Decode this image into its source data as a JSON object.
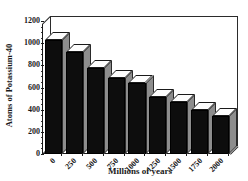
{
  "chart_data": {
    "type": "bar",
    "title": "",
    "xlabel": "Millions of years",
    "ylabel": "Atoms of Potassium-40",
    "categories": [
      "0",
      "250",
      "500",
      "750",
      "1000",
      "1250",
      "1500",
      "1750",
      "2000"
    ],
    "values": [
      1030,
      920,
      780,
      690,
      645,
      515,
      465,
      400,
      345
    ],
    "ylim": [
      0,
      1200
    ],
    "ytick_labels": [
      "0",
      "200",
      "400",
      "600",
      "800",
      "1000",
      "1200"
    ],
    "ytick_values": [
      0,
      200,
      400,
      600,
      800,
      1000,
      1200
    ],
    "grid": false,
    "legend": "none",
    "style": {
      "three_d": true,
      "bar_front_color": "#0d0d0d",
      "bar_top_color": "#fdfdfd",
      "bar_side_color": "#8d8d8d",
      "axis_color": "#1a1a1a",
      "plot_background": "#ffffff"
    }
  }
}
